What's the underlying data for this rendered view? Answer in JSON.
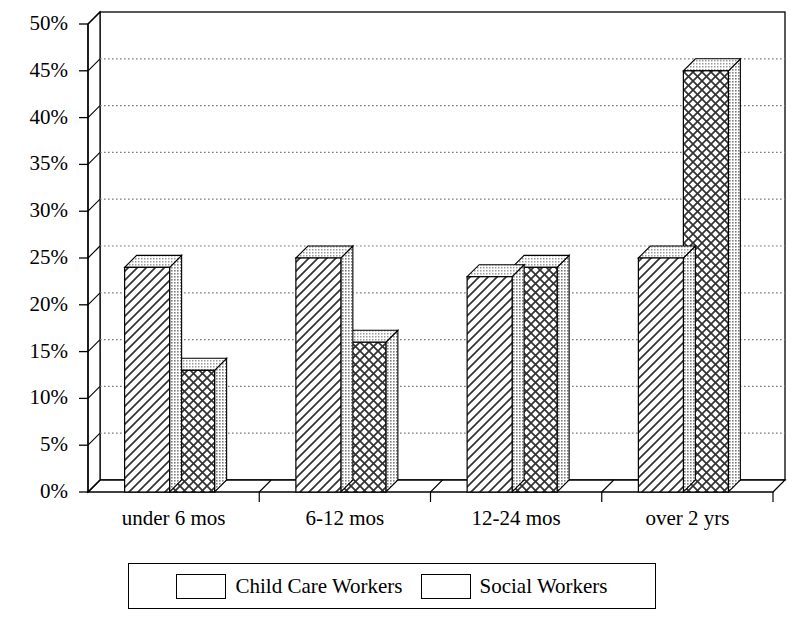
{
  "chart_data": {
    "type": "bar",
    "title": "",
    "subtitle": "",
    "xlabel": "",
    "ylabel": "",
    "categories": [
      "under 6 mos",
      "6-12 mos",
      "12-24 mos",
      "over 2 yrs"
    ],
    "series": [
      {
        "name": "Child Care Workers",
        "pattern": "diagonal-hatch",
        "values": [
          24,
          25,
          23,
          25
        ]
      },
      {
        "name": "Social Workers",
        "pattern": "cross-hatch",
        "values": [
          13,
          16,
          24,
          45
        ]
      }
    ],
    "ylim": [
      0,
      50
    ],
    "yticks": [
      "0%",
      "5%",
      "10%",
      "15%",
      "20%",
      "25%",
      "30%",
      "35%",
      "40%",
      "45%",
      "50%"
    ],
    "ytick_values": [
      0,
      5,
      10,
      15,
      20,
      25,
      30,
      35,
      40,
      45,
      50
    ],
    "grid": "horizontal-dotted",
    "legend_position": "bottom",
    "style": "3d-clustered-bar",
    "colors": {
      "background": "#ffffff",
      "axis": "#000000",
      "grid": "#7a7a7a",
      "bar_face": "#ffffff",
      "bar_side": "#b3b3b3",
      "bar_top": "#cccccc",
      "bar_outline": "#000000"
    }
  },
  "legend": {
    "entries": [
      {
        "label": "Child Care Workers",
        "pattern": "diagonal-hatch"
      },
      {
        "label": "Social Workers",
        "pattern": "cross-hatch"
      }
    ]
  }
}
